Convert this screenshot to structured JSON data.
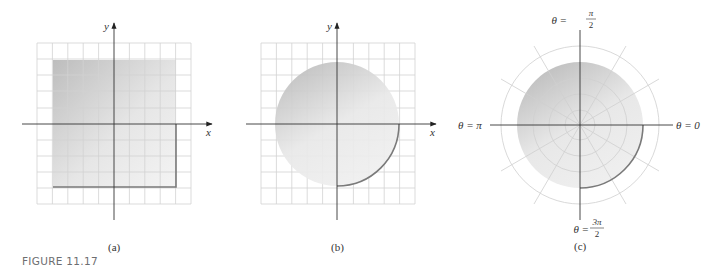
{
  "figure_label": "FIGURE 11.17",
  "panels": {
    "a": {
      "caption": "(a)",
      "x_axis_label": "x",
      "y_axis_label": "y",
      "region": "square"
    },
    "b": {
      "caption": "(b)",
      "x_axis_label": "x",
      "y_axis_label": "y",
      "region": "disk"
    },
    "c": {
      "caption": "(c)",
      "region": "polar disk",
      "labels": {
        "top_theta": "θ =",
        "top_num": "π",
        "top_den": "2",
        "right": "θ = 0",
        "left": "θ = π",
        "bottom_theta": "θ =",
        "bottom_num": "3π",
        "bottom_den": "2"
      }
    }
  },
  "colors": {
    "grid": "#d2d2d2",
    "axis": "#333333",
    "shade_dark": "#c4c4c4",
    "shade_light": "#f2f2f2",
    "edge": "#7a7a7a"
  }
}
